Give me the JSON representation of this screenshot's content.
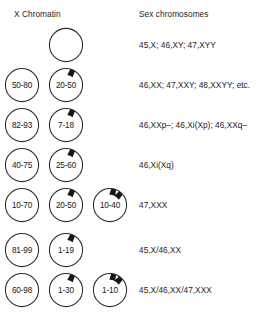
{
  "figure": {
    "title_columns": {
      "x_chromatin": "X Chromatin",
      "sex_chromosomes": "Sex chromosomes"
    },
    "colors": {
      "background": "#ffffff",
      "outline": "#2b2b2b",
      "barr_body": "#151515",
      "text": "#1d1d1d"
    },
    "rows": [
      {
        "id": "row-1",
        "karyotype": "45,X; 46,XY; 47,XYY",
        "nuclei": [
          {
            "column": 2,
            "label": "",
            "barr_bodies": 0
          }
        ]
      },
      {
        "id": "row-2",
        "karyotype": "46,XX; 47,XXY; 48,XXYY; etc.",
        "nuclei": [
          {
            "column": 1,
            "label": "50-80",
            "barr_bodies": 0
          },
          {
            "column": 2,
            "label": "20-50",
            "barr_bodies": 1
          }
        ]
      },
      {
        "id": "row-3",
        "karyotype": "46,XXp–; 46,Xi(Xp); 46,XXq–",
        "nuclei": [
          {
            "column": 1,
            "label": "82-93",
            "barr_bodies": 0
          },
          {
            "column": 2,
            "label": "7-18",
            "barr_bodies": 1
          }
        ]
      },
      {
        "id": "row-4",
        "karyotype": "46,Xi(Xq)",
        "nuclei": [
          {
            "column": 1,
            "label": "40-75",
            "barr_bodies": 0
          },
          {
            "column": 2,
            "label": "25-60",
            "barr_bodies": 1
          }
        ]
      },
      {
        "id": "row-5",
        "karyotype": "47,XXX",
        "nuclei": [
          {
            "column": 1,
            "label": "10-70",
            "barr_bodies": 0
          },
          {
            "column": 2,
            "label": "20-50",
            "barr_bodies": 1
          },
          {
            "column": 3,
            "label": "10-40",
            "barr_bodies": 2
          }
        ]
      },
      {
        "id": "row-6",
        "karyotype": "45,X/46,XX",
        "nuclei": [
          {
            "column": 1,
            "label": "81-99",
            "barr_bodies": 0
          },
          {
            "column": 2,
            "label": "1-19",
            "barr_bodies": 1
          }
        ]
      },
      {
        "id": "row-7",
        "karyotype": "45,X/46,XX/47,XXX",
        "nuclei": [
          {
            "column": 1,
            "label": "60-98",
            "barr_bodies": 0
          },
          {
            "column": 2,
            "label": "1-30",
            "barr_bodies": 1
          },
          {
            "column": 3,
            "label": "1-10",
            "barr_bodies": 2
          }
        ]
      }
    ],
    "row_tops": [
      27,
      67,
      107,
      147,
      187,
      232,
      272
    ],
    "icon_names": {
      "nucleus": "nucleus-circle-icon",
      "barr_body": "barr-body-icon"
    }
  }
}
